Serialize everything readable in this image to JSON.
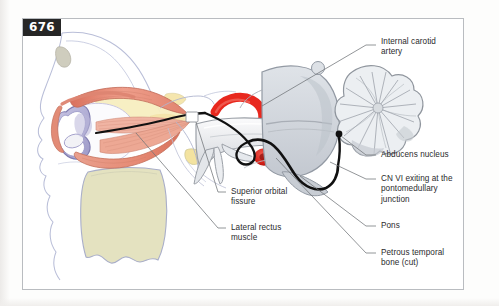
{
  "figure": {
    "page_number": "676",
    "domain": "anatomy-illustration",
    "view": "sagittal cutaway of orbit, petrous temporal bone and brainstem"
  },
  "labels": [
    {
      "id": "internal-carotid-artery",
      "text": "Internal carotid\nartery",
      "x": 381,
      "y": 40
    },
    {
      "id": "abducens-nucleus",
      "text": "Abducens nucleus",
      "x": 381,
      "y": 152
    },
    {
      "id": "cn-vi-exiting",
      "text": "CN VI exiting at the\npontomedullary\njunction",
      "x": 381,
      "y": 175
    },
    {
      "id": "pons",
      "text": "Pons",
      "x": 381,
      "y": 223
    },
    {
      "id": "petrous-temporal-bone",
      "text": "Petrous temporal\nbone (cut)",
      "x": 381,
      "y": 250
    },
    {
      "id": "superior-orbital-fissure",
      "text": "Superior orbital\nfissure",
      "x": 231,
      "y": 188
    },
    {
      "id": "lateral-rectus-muscle",
      "text": "Lateral rectus\nmuscle",
      "x": 231,
      "y": 224
    }
  ],
  "palette": {
    "muscle": "#e8907f",
    "muscle_light": "#f2b6a6",
    "muscle_dark": "#d2705c",
    "artery_red": "#e8281e",
    "bone_cream": "#e4e2c0",
    "sinus_yellow": "#f5e9b4",
    "eye_lavender": "#aaa7d2",
    "brain_grey": "#d2d6dc",
    "brain_grey_dark": "#b3b8bf",
    "nerve_black": "#111111",
    "outline_blue": "#9a9fc4",
    "leader_line": "#6f7377",
    "text": "#2b2b2d",
    "badge_bg": "#262626",
    "frame": "#b9bcc0"
  }
}
